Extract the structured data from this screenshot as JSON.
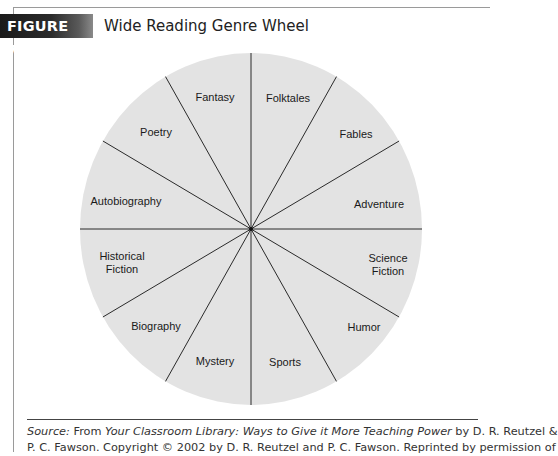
{
  "figure": {
    "label": "FIGURE 7.8",
    "title": "Wide Reading Genre Wheel"
  },
  "wheel": {
    "center": [
      251,
      229
    ],
    "rx": 171,
    "ry": 176,
    "fill": "#e3e3e3",
    "line_color": "#2a2a2a",
    "sectors": [
      {
        "label": [
          "Folktales"
        ],
        "pos": [
          288,
          98
        ]
      },
      {
        "label": [
          "Fables"
        ],
        "pos": [
          356,
          134
        ]
      },
      {
        "label": [
          "Adventure"
        ],
        "pos": [
          379,
          204
        ]
      },
      {
        "label": [
          "Science",
          "Fiction"
        ],
        "pos": [
          388,
          264
        ]
      },
      {
        "label": [
          "Humor"
        ],
        "pos": [
          364,
          327
        ]
      },
      {
        "label": [
          "Sports"
        ],
        "pos": [
          285,
          362
        ]
      },
      {
        "label": [
          "Mystery"
        ],
        "pos": [
          215,
          361
        ]
      },
      {
        "label": [
          "Biography"
        ],
        "pos": [
          156,
          326
        ]
      },
      {
        "label": [
          "Historical",
          "Fiction"
        ],
        "pos": [
          122,
          262
        ]
      },
      {
        "label": [
          "Autobiography"
        ],
        "pos": [
          126,
          201
        ]
      },
      {
        "label": [
          "Poetry"
        ],
        "pos": [
          156,
          132
        ]
      },
      {
        "label": [
          "Fantasy"
        ],
        "pos": [
          215,
          97
        ]
      }
    ]
  },
  "chart_data": {
    "type": "pie",
    "title": "Wide Reading Genre Wheel",
    "categories": [
      "Folktales",
      "Fables",
      "Adventure",
      "Science Fiction",
      "Humor",
      "Sports",
      "Mystery",
      "Biography",
      "Historical Fiction",
      "Autobiography",
      "Poetry",
      "Fantasy"
    ],
    "values": [
      1,
      1,
      1,
      1,
      1,
      1,
      1,
      1,
      1,
      1,
      1,
      1
    ],
    "legend": "none",
    "grid": false
  },
  "source": {
    "prefix": "Source:",
    "from": " From ",
    "book_title": "Your Classroom Library: Ways to Give it More Teaching Power",
    "authors": " by D. R. Reutzel &",
    "line2": "P. C. Fawson. Copyright © 2002 by D. R. Reutzel and P. C. Fawson. Reprinted by permission of"
  }
}
